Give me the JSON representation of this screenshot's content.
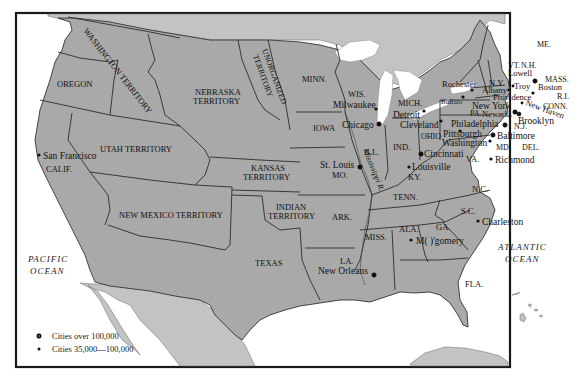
{
  "map": {
    "title": "United States circa 1850s: Territories and Major Cities",
    "colors": {
      "states": "#a9a9a9",
      "foreign_land": "#c3c3c3",
      "water": "#ffffff",
      "frame": "#1a1a1a"
    },
    "regions": {
      "washington_territory": "WASHINGTON TERRITORY",
      "oregon": "OREGON",
      "nebraska_1": "NEBRASKA",
      "nebraska_2": "TERRITORY",
      "unorganized_1": "UNORGANIZED",
      "unorganized_2": "TERRITORY",
      "minn": "MINN.",
      "wis": "WIS.",
      "mich": "MICH.",
      "iowa": "IOWA",
      "ill": "ILL.",
      "ind": "IND.",
      "ohio": "OHIO",
      "utah_territory": "UTAH TERRITORY",
      "calif": "CALIF.",
      "kansas_1": "KANSAS",
      "kansas_2": "TERRITORY",
      "mo": "MO.",
      "ky": "KY.",
      "new_mexico_territory": "NEW MEXICO TERRITORY",
      "indian_1": "INDIAN",
      "indian_2": "TERRITORY",
      "ark": "ARK.",
      "tenn": "TENN.",
      "texas": "TEXAS",
      "la": "LA.",
      "miss": "MISS.",
      "ala": "ALA.",
      "ga": "GA.",
      "sc": "S.C.",
      "nc": "N.C.",
      "va": "VA.",
      "md": "MD.",
      "del": "DEL.",
      "pa": "PA.",
      "nj": "N.J.",
      "ny": "N.Y.",
      "vt": "VT.",
      "nh": "N.H.",
      "me": "ME.",
      "mass": "MASS.",
      "ri": "R.I.",
      "conn": "CONN.",
      "fla": "FLA."
    },
    "rivers": {
      "mississippi": "Mississippi R."
    },
    "oceans": {
      "pacific_1": "PACIFIC",
      "pacific_2": "OCEAN",
      "atlantic_1": "ATLANTIC",
      "atlantic_2": "OCEAN"
    },
    "cities": [
      {
        "name": "San Francisco",
        "size": "35,000-100,000"
      },
      {
        "name": "Milwaukee",
        "size": "35,000-100,000"
      },
      {
        "name": "Chicago",
        "size": "over 100,000"
      },
      {
        "name": "Detroit",
        "size": "35,000-100,000"
      },
      {
        "name": "Cleveland",
        "size": "35,000-100,000"
      },
      {
        "name": "Rochester",
        "size": "35,000-100,000"
      },
      {
        "name": "Buffalo",
        "size": "35,000-100,000"
      },
      {
        "name": "Albany",
        "size": "35,000-100,000"
      },
      {
        "name": "Troy",
        "size": "35,000-100,000"
      },
      {
        "name": "Lowell",
        "size": "35,000-100,000"
      },
      {
        "name": "Boston",
        "size": "over 100,000"
      },
      {
        "name": "Providence",
        "size": "35,000-100,000"
      },
      {
        "name": "New York",
        "size": "over 100,000"
      },
      {
        "name": "New Haven",
        "size": "35,000-100,000"
      },
      {
        "name": "Newark",
        "size": "35,000-100,000"
      },
      {
        "name": "Brooklyn",
        "size": "over 100,000"
      },
      {
        "name": "Philadelphia",
        "size": "over 100,000"
      },
      {
        "name": "Pittsburgh",
        "size": "35,000-100,000"
      },
      {
        "name": "Baltimore",
        "size": "over 100,000"
      },
      {
        "name": "Washington",
        "size": "35,000-100,000"
      },
      {
        "name": "Cincinnati",
        "size": "over 100,000"
      },
      {
        "name": "Louisville",
        "size": "35,000-100,000"
      },
      {
        "name": "St. Louis",
        "size": "over 100,000"
      },
      {
        "name": "Richmond",
        "size": "35,000-100,000"
      },
      {
        "name": "Charleston",
        "size": "35,000-100,000"
      },
      {
        "name": "Montgomery",
        "display": "M(  )'gomery",
        "size": "35,000-100,000"
      },
      {
        "name": "New Orleans",
        "size": "over 100,000"
      }
    ],
    "legend": {
      "large": "Cities over 100,000",
      "small": "Cities 35,000—100,000"
    }
  }
}
